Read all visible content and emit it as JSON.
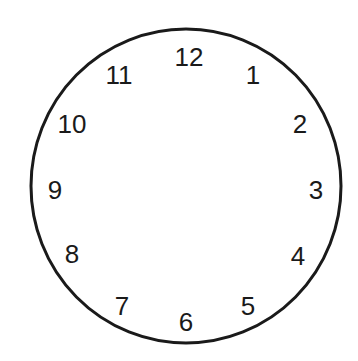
{
  "clock": {
    "face": {
      "cx": 186,
      "cy": 186,
      "rx": 155,
      "ry": 157,
      "stroke": "#1a1a1a",
      "stroke_width": 3
    },
    "numbers": [
      {
        "label": "12",
        "x": 189,
        "y": 66
      },
      {
        "label": "1",
        "x": 253,
        "y": 84
      },
      {
        "label": "2",
        "x": 300,
        "y": 133
      },
      {
        "label": "3",
        "x": 316,
        "y": 199
      },
      {
        "label": "4",
        "x": 298,
        "y": 265
      },
      {
        "label": "5",
        "x": 248,
        "y": 315
      },
      {
        "label": "6",
        "x": 186,
        "y": 331
      },
      {
        "label": "7",
        "x": 122,
        "y": 315
      },
      {
        "label": "8",
        "x": 72,
        "y": 263
      },
      {
        "label": "9",
        "x": 55,
        "y": 199
      },
      {
        "label": "10",
        "x": 72,
        "y": 133
      },
      {
        "label": "11",
        "x": 119,
        "y": 84
      }
    ]
  }
}
